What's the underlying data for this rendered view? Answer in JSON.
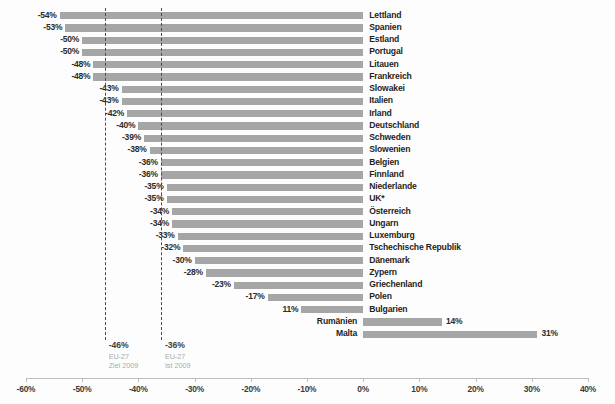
{
  "chart_data": {
    "type": "bar",
    "orientation": "horizontal",
    "title": "",
    "subtitle": "",
    "xlabel": "",
    "ylabel": "",
    "xlim": [
      -60,
      40
    ],
    "xticks": [
      -60,
      -50,
      -40,
      -30,
      -20,
      -10,
      0,
      10,
      20,
      30,
      40
    ],
    "xtick_labels": [
      "-60%",
      "-50%",
      "-40%",
      "-30%",
      "-20%",
      "-10%",
      "0%",
      "10%",
      "20%",
      "30%",
      "40%"
    ],
    "grid": false,
    "legend": "none",
    "bar_color": "#a6a6a6",
    "categories": [
      "Lettland",
      "Spanien",
      "Estland",
      "Portugal",
      "Litauen",
      "Frankreich",
      "Slowakei",
      "Italien",
      "Irland",
      "Deutschland",
      "Schweden",
      "Slowenien",
      "Belgien",
      "Finnland",
      "Niederlande",
      "UK*",
      "Österreich",
      "Ungarn",
      "Luxemburg",
      "Tschechische Republik",
      "Dänemark",
      "Zypern",
      "Griechenland",
      "Polen",
      "Bulgarien",
      "Rumänien",
      "Malta"
    ],
    "values": [
      -54,
      -53,
      -50,
      -50,
      -48,
      -48,
      -43,
      -43,
      -42,
      -40,
      -39,
      -38,
      -36,
      -36,
      -35,
      -35,
      -34,
      -34,
      -33,
      -32,
      -30,
      -28,
      -23,
      -17,
      -11,
      14,
      31
    ],
    "data_labels": [
      "-54%",
      "-53%",
      "-50%",
      "-50%",
      "-48%",
      "-48%",
      "-43%",
      "-43%",
      "-42%",
      "-40%",
      "-39%",
      "-38%",
      "-36%",
      "-36%",
      "-35%",
      "-35%",
      "-34%",
      "-34%",
      "-33%",
      "-32%",
      "-30%",
      "-28%",
      "-23%",
      "-17%",
      "11%",
      "14%",
      "31%"
    ],
    "reference_lines": [
      {
        "value": -46,
        "label_value": "-46%",
        "label_name": "EU-27",
        "label_year": "Ziel 2009",
        "style": "dashed"
      },
      {
        "value": -36,
        "label_value": "-36%",
        "label_name": "EU-27",
        "label_year": "Ist 2009",
        "style": "dashed"
      }
    ]
  }
}
